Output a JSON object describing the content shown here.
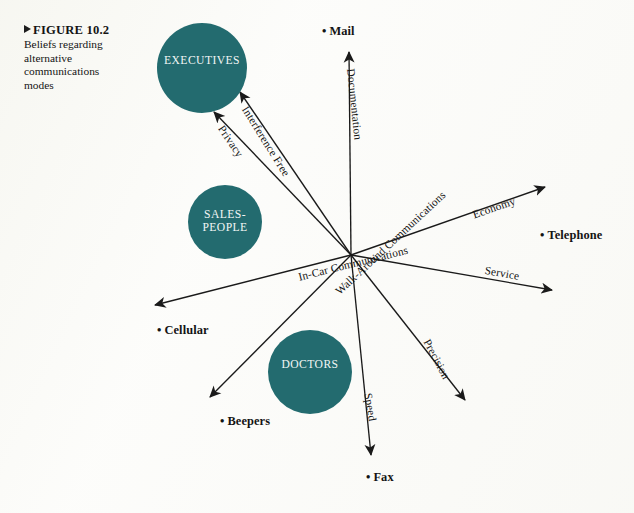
{
  "figure": {
    "marker_icon": "right-triangle-icon",
    "title": "FIGURE 10.2",
    "subtitle": "Beliefs regarding alternative communications modes"
  },
  "colors": {
    "bubble_teal": "#236b6f",
    "bubble_text": "#f2f6f5",
    "vector_stroke": "#1a1a1a",
    "page_background": "#fdfdfb"
  },
  "chart_data": {
    "type": "scatter",
    "title": "FIGURE 10.2",
    "subtitle": "Beliefs regarding alternative communications modes",
    "xlabel": "",
    "ylabel": "",
    "grid": false,
    "legend": null,
    "origin": {
      "x": 351,
      "y": 255
    },
    "groups": [
      {
        "name": "EXECUTIVES",
        "label": "EXECUTIVES",
        "cx": 202,
        "cy": 68,
        "r": 45
      },
      {
        "name": "SALESPEOPLE",
        "label": "SALES-\nPEOPLE",
        "cx": 225,
        "cy": 222,
        "r": 37
      },
      {
        "name": "DOCTORS",
        "label": "DOCTORS",
        "cx": 310,
        "cy": 372,
        "r": 42
      }
    ],
    "modes": [
      {
        "label": "Mail",
        "x": 322,
        "y": 32
      },
      {
        "label": "Telephone",
        "x": 540,
        "y": 236
      },
      {
        "label": "Service",
        "x": 0,
        "y": 0
      },
      {
        "label": "Cellular",
        "x": 157,
        "y": 331
      },
      {
        "label": "Beepers",
        "x": 220,
        "y": 422
      },
      {
        "label": "Fax",
        "x": 366,
        "y": 478
      }
    ],
    "mode_points": [
      {
        "label": "Mail",
        "x": 322,
        "y": 32
      },
      {
        "label": "Telephone",
        "x": 540,
        "y": 236
      },
      {
        "label": "Cellular",
        "x": 157,
        "y": 331
      },
      {
        "label": "Beepers",
        "x": 220,
        "y": 422
      },
      {
        "label": "Fax",
        "x": 366,
        "y": 478
      }
    ],
    "attribute_vectors": [
      {
        "label": "Documentation",
        "x2": 349,
        "y2": 52,
        "angle_deg": -90,
        "label_rot": 84,
        "label_x": 357,
        "label_y": 68
      },
      {
        "label": "Interference Free",
        "x2": 240,
        "y2": 92,
        "angle_deg": -132,
        "label_rot": 58,
        "label_x": 250,
        "label_y": 104
      },
      {
        "label": "Privacy",
        "x2": 214,
        "y2": 112,
        "angle_deg": -141,
        "label_rot": 56,
        "label_x": 226,
        "label_y": 123
      },
      {
        "label": "Economy",
        "x2": 545,
        "y2": 187,
        "angle_deg": -20,
        "label_rot": -19,
        "label_x": 471,
        "label_y": 209
      },
      {
        "label": "Service",
        "x2": 552,
        "y2": 290,
        "angle_deg": 10,
        "label_rot": 10,
        "label_x": 486,
        "label_y": 264
      },
      {
        "label": "Precision",
        "x2": 465,
        "y2": 400,
        "angle_deg": 46,
        "label_rot": 62,
        "label_x": 432,
        "label_y": 337
      },
      {
        "label": "Speed",
        "x2": 371,
        "y2": 455,
        "angle_deg": 84,
        "label_rot": 80,
        "label_x": 374,
        "label_y": 392
      },
      {
        "label": "Walk-Around Communications",
        "x2": 210,
        "y2": 397,
        "angle_deg": 134,
        "label_rot": -43,
        "label_x": 333,
        "label_y": 288
      },
      {
        "label": "In-Car Communications",
        "x2": 155,
        "y2": 305,
        "angle_deg": 166,
        "label_rot": -14,
        "label_x": 297,
        "label_y": 271
      }
    ]
  }
}
